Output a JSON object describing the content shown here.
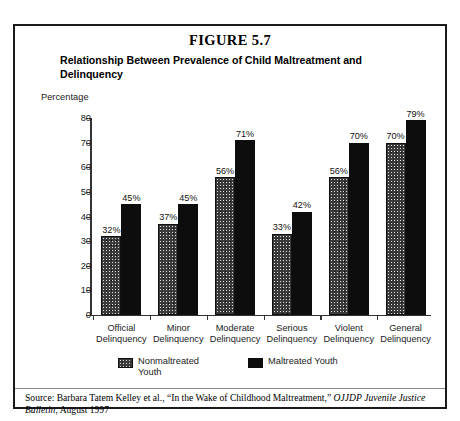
{
  "figure": {
    "number_label": "FIGURE 5.7",
    "subtitle": "Relationship Between Prevalence of Child Maltreatment and Delinquency",
    "axis_unit_label": "Percentage"
  },
  "source": {
    "prefix": "Source: Barbara Tatem Kelley et al., “In the Wake of Childhood Maltreatment,” ",
    "italic_1": "OJJDP",
    "middle": " ",
    "italic_2": "Juvenile Justice Bulletin",
    "suffix": ", August 1997"
  },
  "legend": {
    "items": [
      {
        "label": "Nonmaltreated Youth",
        "swatch": "textured-gray",
        "color": "#3a3a3a"
      },
      {
        "label": "Maltreated Youth",
        "swatch": "solid-black",
        "color": "#0d0d0d"
      }
    ]
  },
  "chart_data": {
    "type": "bar",
    "title": "Relationship Between Prevalence of Child Maltreatment and Delinquency",
    "xlabel": "",
    "ylabel": "Percentage",
    "ylim": [
      0,
      80
    ],
    "yticks": [
      0,
      10,
      20,
      30,
      40,
      50,
      60,
      70,
      80
    ],
    "grid": false,
    "legend_position": "bottom",
    "categories": [
      "Official Delinquency",
      "Minor Delinquency",
      "Moderate Delinquency",
      "Serious Delinquency",
      "Violent Delinquency",
      "General Delinquency"
    ],
    "category_lines": [
      [
        "Official",
        "Delinquency"
      ],
      [
        "Minor",
        "Delinquency"
      ],
      [
        "Moderate",
        "Delinquency"
      ],
      [
        "Serious",
        "Delinquency"
      ],
      [
        "Violent",
        "Delinquency"
      ],
      [
        "General",
        "Delinquency"
      ]
    ],
    "series": [
      {
        "name": "Nonmaltreated Youth",
        "color": "#3a3a3a",
        "values": [
          32,
          37,
          56,
          33,
          56,
          70
        ],
        "labels": [
          "32%",
          "37%",
          "56%",
          "33%",
          "56%",
          "70%"
        ]
      },
      {
        "name": "Maltreated Youth",
        "color": "#0d0d0d",
        "values": [
          45,
          45,
          71,
          42,
          70,
          79
        ],
        "labels": [
          "45%",
          "45%",
          "71%",
          "42%",
          "70%",
          "79%"
        ]
      }
    ]
  }
}
